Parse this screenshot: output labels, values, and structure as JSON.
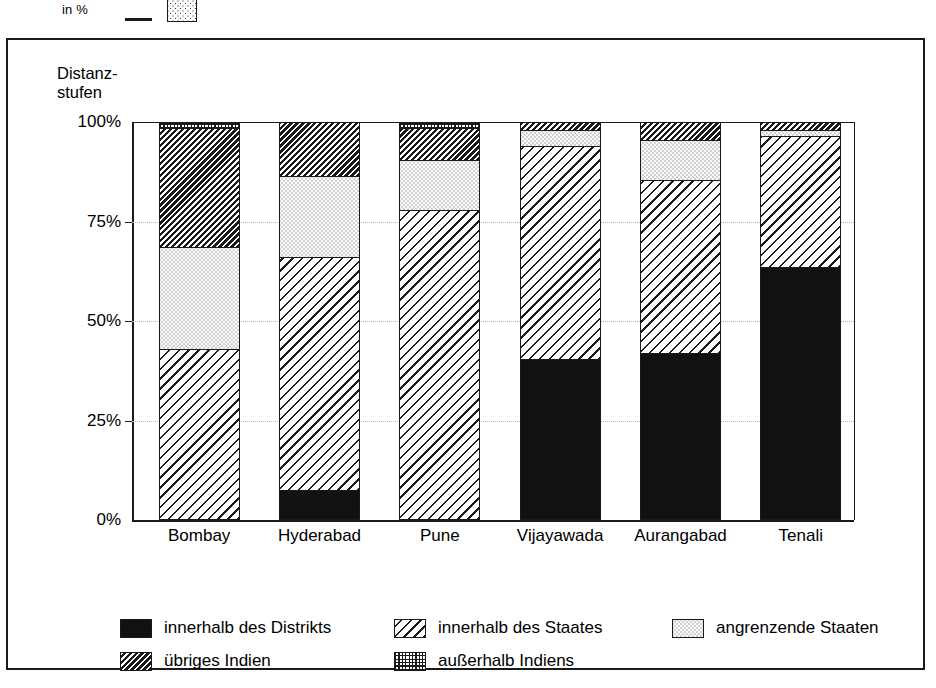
{
  "top_strip": {
    "unit_label": "in %",
    "swatches": [
      "line-swatch",
      "dotted-swatch"
    ]
  },
  "axis_caption": "Distanz-\nstufen",
  "chart_data": {
    "type": "bar",
    "subtype": "stacked-100-percent",
    "xlabel": "",
    "ylabel": "in %",
    "ylim": [
      0,
      100
    ],
    "ytick_labels": [
      "0%",
      "25%",
      "50%",
      "75%",
      "100%"
    ],
    "ytick_values": [
      0,
      25,
      50,
      75,
      100
    ],
    "grid": true,
    "legend_position": "bottom",
    "categories": [
      "Bombay",
      "Hyderabad",
      "Pune",
      "Vijayawada",
      "Aurangabad",
      "Tenali"
    ],
    "series": [
      {
        "name": "innerhalb des Distrikts",
        "pattern": "solid-black",
        "values": [
          0,
          7.5,
          0,
          40.5,
          42.0,
          63.5
        ]
      },
      {
        "name": "innerhalb des Staates",
        "pattern": "wide-diagonal-hatch",
        "values": [
          43.0,
          58.5,
          78.0,
          53.5,
          43.5,
          33.0
        ]
      },
      {
        "name": "angrenzende Staaten",
        "pattern": "fine-stipple",
        "values": [
          25.5,
          20.5,
          12.5,
          4.0,
          10.0,
          1.5
        ]
      },
      {
        "name": "übriges Indien",
        "pattern": "dense-diagonal-hatch",
        "values": [
          30.0,
          13.5,
          8.0,
          2.0,
          4.5,
          2.0
        ]
      },
      {
        "name": "außerhalb Indiens",
        "pattern": "checker-stipple",
        "values": [
          1.5,
          0.0,
          1.5,
          0.0,
          0.0,
          0.0
        ]
      }
    ],
    "colors": {
      "ink": "#1a1a1a",
      "background": "#ffffff",
      "gridline": "#b5b5b5"
    }
  },
  "legend": {
    "rows": [
      [
        {
          "label": "innerhalb des Distrikts",
          "pattern": "solid-black"
        },
        {
          "label": "innerhalb des Staates",
          "pattern": "wide-diagonal-hatch"
        },
        {
          "label": "angrenzende Staaten",
          "pattern": "fine-stipple"
        }
      ],
      [
        {
          "label": "übriges Indien",
          "pattern": "dense-diagonal-hatch"
        },
        {
          "label": "außerhalb Indiens",
          "pattern": "checker-stipple"
        }
      ]
    ]
  }
}
